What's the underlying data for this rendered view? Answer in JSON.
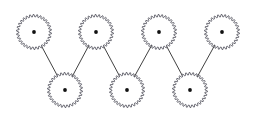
{
  "figure": {
    "background_color": "#ffffff",
    "width": 257,
    "height": 124
  },
  "style": {
    "gear_outline_color": "#4a4a55",
    "gear_fill_color": "#ffffff",
    "hub_color": "#111111",
    "link_color": "#2b2b2b",
    "gear_outline_width": 0.8,
    "link_width": 0.9,
    "teeth_count": 30,
    "gear_radius": 17.5,
    "tooth_height": 2.4,
    "hub_radius": 1.9
  },
  "gears": [
    {
      "id": "gear-top-1",
      "label": "Gear 1",
      "row": "top",
      "cx": 34,
      "cy": 32
    },
    {
      "id": "gear-top-2",
      "label": "Gear 3",
      "row": "top",
      "cx": 96,
      "cy": 32
    },
    {
      "id": "gear-top-3",
      "label": "Gear 5",
      "row": "top",
      "cx": 159,
      "cy": 32
    },
    {
      "id": "gear-top-4",
      "label": "Gear 7",
      "row": "top",
      "cx": 222,
      "cy": 32
    },
    {
      "id": "gear-bottom-1",
      "label": "Gear 2",
      "row": "bottom",
      "cx": 65,
      "cy": 90
    },
    {
      "id": "gear-bottom-2",
      "label": "Gear 4",
      "row": "bottom",
      "cx": 127,
      "cy": 90
    },
    {
      "id": "gear-bottom-3",
      "label": "Gear 6",
      "row": "bottom",
      "cx": 190,
      "cy": 90
    }
  ],
  "links": [
    {
      "id": "link-1",
      "from": "gear-top-1",
      "to": "gear-bottom-1",
      "x1": 34,
      "y1": 32,
      "x2": 65,
      "y2": 90
    },
    {
      "id": "link-2",
      "from": "gear-bottom-1",
      "to": "gear-top-2",
      "x1": 65,
      "y1": 90,
      "x2": 96,
      "y2": 32
    },
    {
      "id": "link-3",
      "from": "gear-top-2",
      "to": "gear-bottom-2",
      "x1": 96,
      "y1": 32,
      "x2": 127,
      "y2": 90
    },
    {
      "id": "link-4",
      "from": "gear-bottom-2",
      "to": "gear-top-3",
      "x1": 127,
      "y1": 90,
      "x2": 159,
      "y2": 32
    },
    {
      "id": "link-5",
      "from": "gear-top-3",
      "to": "gear-bottom-3",
      "x1": 159,
      "y1": 32,
      "x2": 190,
      "y2": 90
    },
    {
      "id": "link-6",
      "from": "gear-bottom-3",
      "to": "gear-top-4",
      "x1": 190,
      "y1": 90,
      "x2": 222,
      "y2": 32
    }
  ]
}
